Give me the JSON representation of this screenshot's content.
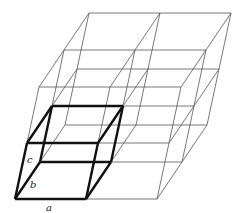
{
  "diagram": {
    "type": "crystal lattice",
    "grid": {
      "na": 2,
      "nb": 2,
      "nc": 2
    },
    "origin": [
      15,
      199
    ],
    "vectors": {
      "a": [
        71,
        0
      ],
      "b": [
        25,
        -37
      ],
      "c": [
        12,
        -56
      ]
    },
    "colors": {
      "thin": "#555555",
      "bold": "#111111",
      "background": "#ffffff"
    },
    "labels": {
      "a": {
        "text": "a",
        "x": 46,
        "y": 211
      },
      "b": {
        "text": "b",
        "x": 30,
        "y": 188
      },
      "c": {
        "text": "c",
        "x": 27,
        "y": 163
      }
    }
  }
}
